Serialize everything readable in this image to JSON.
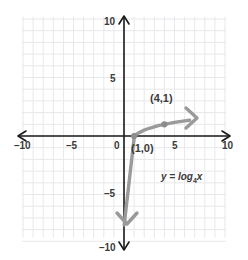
{
  "chart_data": {
    "type": "line",
    "title": "",
    "xlabel": "",
    "ylabel": "",
    "xlim": [
      -10,
      10
    ],
    "ylim": [
      -10,
      10
    ],
    "grid": true,
    "legend": null,
    "equation_text": "y = log",
    "equation_base": "4",
    "equation_arg": "x",
    "function": "y = log_4 x",
    "series": [
      {
        "name": "y = log_4 x",
        "color": "#9a9a9a",
        "x": [
          1.0,
          1.2,
          1.5,
          2.0,
          2.5,
          3.0,
          3.5,
          4.0,
          4.5,
          5.0,
          5.5,
          6.0,
          6.5
        ],
        "y": [
          0.0,
          0.13,
          0.29,
          0.5,
          0.66,
          0.79,
          0.9,
          1.0,
          1.08,
          1.16,
          1.23,
          1.29,
          1.35
        ],
        "asymptote_x": 0,
        "arrow_start": "down",
        "arrow_end": "right"
      }
    ],
    "points": [
      {
        "label": "(1,0)",
        "x": 1,
        "y": 0
      },
      {
        "label": "(4,1)",
        "x": 4,
        "y": 1
      }
    ],
    "x_ticks": [
      {
        "value": -10,
        "label": "–10"
      },
      {
        "value": -5,
        "label": "–5"
      },
      {
        "value": 0,
        "label": "0"
      },
      {
        "value": 5,
        "label": "5"
      },
      {
        "value": 10,
        "label": "10"
      }
    ],
    "y_ticks": [
      {
        "value": 10,
        "label": "10"
      },
      {
        "value": 5,
        "label": "5"
      },
      {
        "value": -5,
        "label": "–5"
      },
      {
        "value": -10,
        "label": "–10"
      }
    ],
    "colors": {
      "axis": "#1a1a1a",
      "grid": "#e8e8ec",
      "curve": "#9a9a9a",
      "point": "#8c8c8c",
      "text": "#3b3b3b",
      "background": "#ffffff"
    }
  }
}
